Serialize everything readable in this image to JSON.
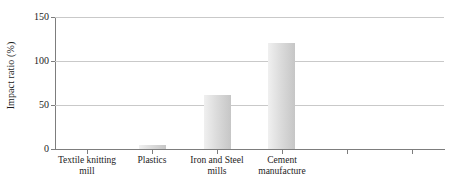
{
  "chart_data": {
    "type": "bar",
    "title": "",
    "xlabel": "",
    "ylabel": "Impact ratio (%)",
    "categories": [
      "Textile knitting mill",
      "Plastics",
      "Iron and Steel mills",
      "Cement manufacture",
      "",
      ""
    ],
    "values": [
      0,
      5,
      61,
      121,
      null,
      null
    ],
    "ylim": [
      0,
      150
    ],
    "yticks": [
      0,
      50,
      100,
      150
    ],
    "ytick_labels": [
      "0",
      "50",
      "100",
      "150"
    ],
    "grid": true,
    "legend": false,
    "series": [
      {
        "name": "Impact ratio",
        "values": [
          0,
          5,
          61,
          121,
          null,
          null
        ],
        "color": "#d2d2d2"
      }
    ],
    "colors": {
      "bar_light": "#f0f0f0",
      "bar_mid": "#dcdcdc",
      "bar_dark": "#c6c6c6",
      "gridline": "#c9c9c9",
      "axis": "#7d7d7d",
      "text": "#1c1c1c"
    }
  }
}
